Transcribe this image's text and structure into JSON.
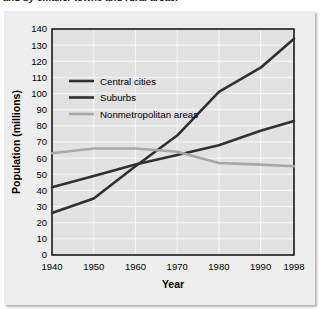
{
  "caption": {
    "text": "and by smaller towns and rural areas."
  },
  "chart_data": {
    "type": "line",
    "title": "",
    "xlabel": "Year",
    "ylabel": "Population (millions)",
    "x": [
      1940,
      1950,
      1960,
      1970,
      1980,
      1990,
      1998
    ],
    "xtick_labels": [
      "1940",
      "1950",
      "1960",
      "1970",
      "1980",
      "1990",
      "1998"
    ],
    "xlim": [
      1940,
      1998
    ],
    "ylim": [
      0,
      140
    ],
    "ytick_labels": [
      "0",
      "10",
      "20",
      "30",
      "40",
      "50",
      "60",
      "70",
      "80",
      "90",
      "100",
      "110",
      "120",
      "130",
      "140"
    ],
    "ytick_values": [
      0,
      10,
      20,
      30,
      40,
      50,
      60,
      70,
      80,
      90,
      100,
      110,
      120,
      130,
      140
    ],
    "grid": true,
    "legend_position": "upper-left-inside",
    "series": [
      {
        "name": "Central cities",
        "values": [
          42,
          49,
          56,
          62,
          68,
          77,
          83
        ],
        "color": "#303030",
        "width": 2.6
      },
      {
        "name": "Suburbs",
        "values": [
          26,
          35,
          55,
          74,
          101,
          116,
          134
        ],
        "color": "#303030",
        "width": 2.6
      },
      {
        "name": "Nonmetropolitan areas",
        "values": [
          63,
          66,
          66,
          64,
          57,
          56,
          55
        ],
        "color": "#a8a8a8",
        "width": 2.6
      }
    ]
  },
  "colors": {
    "panel_background": "#eeeeee",
    "plot_background": "#e2e2e2",
    "grid": "#f7f7f7",
    "axis": "#1a1a1a",
    "dark_series": "#303030",
    "light_series": "#a8a8a8"
  }
}
